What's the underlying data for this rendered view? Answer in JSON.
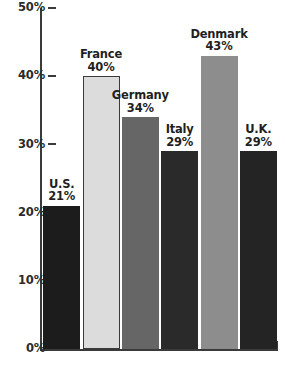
{
  "chart_data": {
    "type": "bar",
    "title": "",
    "subtitle": "",
    "xlabel": "",
    "ylabel": "",
    "categories": [
      "U.S.",
      "France",
      "Germany",
      "Italy",
      "Denmark",
      "U.K."
    ],
    "values": [
      21,
      40,
      34,
      29,
      43,
      29
    ],
    "value_labels": [
      "21%",
      "40%",
      "34%",
      "29%",
      "43%",
      "29%"
    ],
    "bar_colors": [
      "#1c1c1c",
      "#dcdcdc",
      "#666666",
      "#2a2a2a",
      "#8d8d8d",
      "#242424"
    ],
    "bar_borders": [
      "#1c1c1c",
      "#3a3a3a",
      "#666666",
      "#2a2a2a",
      "#8d8d8d",
      "#242424"
    ],
    "ylim": [
      0,
      50
    ],
    "yticks": [
      0,
      10,
      20,
      30,
      40,
      50
    ],
    "ytick_labels": [
      "0%",
      "10%",
      "20%",
      "30%",
      "40%",
      "50%"
    ],
    "grid": false,
    "legend": "none",
    "axis_color": "#3a3a3a"
  }
}
